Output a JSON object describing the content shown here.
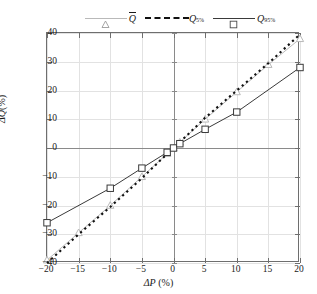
{
  "chart_data": {
    "type": "line",
    "title": "",
    "xlabel": "ΔP (%)",
    "ylabel": "ΔQ(%)",
    "xlim": [
      -20,
      20
    ],
    "ylim": [
      -40,
      40
    ],
    "xticks": [
      -20,
      -15,
      -10,
      -5,
      0,
      5,
      10,
      15,
      20
    ],
    "xticklabels": [
      "−20",
      "−15",
      "−10",
      "−5",
      "0",
      "5",
      "10",
      "15",
      "20"
    ],
    "yticks": [
      -40,
      -30,
      -20,
      -10,
      0,
      10,
      20,
      30,
      40
    ],
    "yticklabels": [
      "−40",
      "−30",
      "−20",
      "−10",
      "0",
      "10",
      "20",
      "30",
      "40"
    ],
    "grid": true,
    "legend_position": "top-center",
    "series": [
      {
        "name": "Qbar",
        "label_base": "Q",
        "label_sub": "",
        "label_overbar": true,
        "color": "#b9b9b9",
        "linestyle": "solid",
        "marker": "triangle-open",
        "x": [
          -20,
          -15,
          -10,
          -5,
          -1,
          0,
          1,
          5,
          10,
          15,
          20
        ],
        "y": [
          -39.0,
          -29.5,
          -20.0,
          -10.0,
          -2.0,
          0.0,
          2.0,
          10.0,
          19.5,
          29.0,
          38.0
        ]
      },
      {
        "name": "Q5",
        "label_base": "Q",
        "label_sub": "5%",
        "label_overbar": false,
        "color": "#111111",
        "linestyle": "dashed",
        "marker": "none",
        "x": [
          -20,
          -15,
          -10,
          -5,
          -1,
          0,
          1,
          5,
          10,
          15,
          20
        ],
        "y": [
          -40.0,
          -30.0,
          -20.5,
          -10.5,
          -2.0,
          0.0,
          2.0,
          10.5,
          20.0,
          29.5,
          39.5
        ]
      },
      {
        "name": "Q95",
        "label_base": "Q",
        "label_sub": "95%",
        "label_overbar": false,
        "color": "#3a3a3a",
        "linestyle": "solid",
        "marker": "square-open",
        "x": [
          -20,
          -10,
          -5,
          -1,
          0,
          1,
          5,
          10,
          20
        ],
        "y": [
          -26.0,
          -14.0,
          -7.0,
          -1.5,
          0.0,
          1.5,
          6.5,
          12.5,
          28.0
        ]
      }
    ]
  },
  "legend": {
    "items": [
      {
        "label_base": "Q",
        "label_sub": "",
        "overbar": true
      },
      {
        "label_base": "Q",
        "label_sub": "5%",
        "overbar": false
      },
      {
        "label_base": "Q",
        "label_sub": "95%",
        "overbar": false
      }
    ]
  },
  "axes": {
    "x_title_sym": "ΔP",
    "x_title_unit": " (%)",
    "y_title_sym": "ΔQ",
    "y_title_unit": "(%)"
  }
}
